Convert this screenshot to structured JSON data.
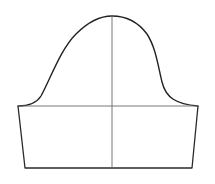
{
  "diagram": {
    "type": "sleeve-pattern",
    "colors": {
      "outline": "#2a2a2a",
      "guide": "#6a6a6a",
      "background": "#ffffff"
    },
    "points": {
      "cap_peak": [
        112,
        16
      ],
      "biceps_left": [
        18,
        106
      ],
      "biceps_right": [
        198,
        106
      ],
      "hem_left": [
        25,
        168
      ],
      "hem_right": [
        192,
        168
      ]
    },
    "lines": {
      "biceps_line": "horizontal guide at y=106",
      "center_line": "vertical guide at x=112 from cap peak to hem"
    }
  }
}
